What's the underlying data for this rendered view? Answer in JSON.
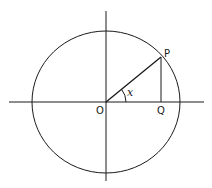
{
  "diagram": {
    "labels": {
      "origin": "O",
      "point_p": "P",
      "point_q": "Q",
      "angle": "x"
    },
    "colors": {
      "stroke": "#1a1a1a",
      "background": "#ffffff"
    },
    "geometry": {
      "center": [
        106,
        102
      ],
      "radius_x": 74,
      "radius_y": 71,
      "point_p": [
        161,
        57
      ],
      "point_q": [
        161,
        102
      ]
    }
  }
}
